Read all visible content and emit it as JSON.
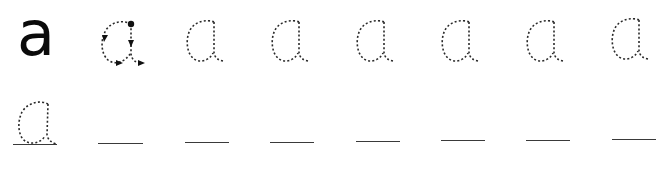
{
  "worksheet": {
    "letter": "a",
    "model": {
      "label": "a",
      "style": "solid",
      "color": "#0a0a0a"
    },
    "guide": {
      "label": "a",
      "style": "dotted-with-direction-arrows",
      "start_marker": "filled-dot",
      "arrows": [
        "left-down arrow on bowl top-left",
        "down arrow on stem",
        "right arrow on bowl bottom",
        "right arrow on exit stroke"
      ]
    },
    "row1_tracing": [
      {
        "label": "a",
        "style": "dotted"
      },
      {
        "label": "a",
        "style": "dotted"
      },
      {
        "label": "a",
        "style": "dotted"
      },
      {
        "label": "a",
        "style": "dotted"
      },
      {
        "label": "a",
        "style": "dotted"
      },
      {
        "label": "a",
        "style": "dotted"
      }
    ],
    "row2": {
      "tracing_letter": {
        "label": "a",
        "style": "dotted-on-baseline"
      },
      "blank_lines_count": 7
    },
    "colors": {
      "background": "#ffffff",
      "ink": "#0a0a0a",
      "dots": "#2a2a2a",
      "lines": "#3a3a3a"
    }
  }
}
